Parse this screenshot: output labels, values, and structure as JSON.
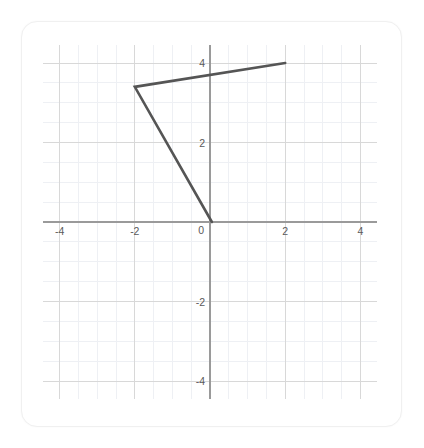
{
  "card": {
    "background_color": "#ffffff",
    "border_color": "#f0f0f0"
  },
  "chart_data": {
    "type": "line",
    "title": "",
    "subtitle": "",
    "xlabel": "",
    "ylabel": "",
    "xlim": [
      -4.45,
      4.45
    ],
    "ylim": [
      -4.45,
      4.45
    ],
    "grid": true,
    "legend": null,
    "legend_position": "none",
    "axis_color": "#9a9a9a",
    "major_grid_color": "#d8d8d8",
    "minor_grid_color": "#eef0f4",
    "series_color": "#555555",
    "x_ticks": [
      -4,
      -2,
      0,
      2,
      4
    ],
    "x_tick_labels": [
      "-4",
      "-2",
      "0",
      "2",
      "4"
    ],
    "y_ticks": [
      -4,
      -2,
      0,
      2,
      4
    ],
    "y_tick_labels": [
      "-4",
      "-2",
      "0",
      "2",
      "4"
    ],
    "major_step": 2,
    "minor_step": 0.5,
    "series": [
      {
        "name": "polyline",
        "points": [
          [
            2.0,
            4.0
          ],
          [
            -2.0,
            3.4
          ],
          [
            0.05,
            0.0
          ]
        ]
      }
    ],
    "annotations": []
  },
  "labels": {
    "x_neg4": "-4",
    "x_neg2": "-2",
    "x_zero": "0",
    "x_pos2": "2",
    "x_pos4": "4",
    "y_neg4": "-4",
    "y_neg2": "-2",
    "y_pos2": "2",
    "y_pos4": "4"
  }
}
